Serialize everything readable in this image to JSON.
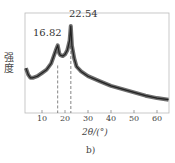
{
  "chart_data": {
    "type": "line",
    "title": "",
    "caption": "b)",
    "xlabel": "2θ/(°)",
    "ylabel": "强度",
    "xlim": [
      3,
      65
    ],
    "xticks": [
      10,
      20,
      30,
      40,
      50,
      60
    ],
    "yticks": [],
    "grid": false,
    "legend": null,
    "annotations": [
      {
        "label": "16.82",
        "x": 16.82,
        "dashed_line": true
      },
      {
        "label": "22.54",
        "x": 22.54,
        "dashed_line": true
      }
    ],
    "series": [
      {
        "name": "XRD",
        "x": [
          3,
          4,
          5,
          6,
          8,
          10,
          12,
          14,
          15,
          16,
          16.82,
          17.5,
          18,
          19,
          20,
          21,
          22,
          22.54,
          23,
          24,
          25,
          27,
          30,
          35,
          40,
          45,
          50,
          55,
          60,
          65
        ],
        "y": [
          48,
          40,
          36,
          36,
          38,
          42,
          46,
          54,
          62,
          70,
          76,
          66,
          64,
          63,
          65,
          70,
          82,
          100,
          76,
          60,
          50,
          44,
          38,
          32,
          26,
          22,
          18,
          14,
          11,
          9
        ]
      }
    ]
  }
}
